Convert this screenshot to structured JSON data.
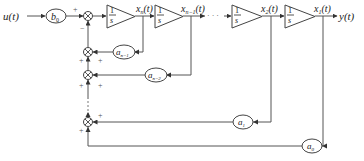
{
  "diagram": {
    "type": "block-diagram",
    "input_label": "u(t)",
    "output_label": "y(t)",
    "input_gain": {
      "label": "b",
      "subscript": "0"
    },
    "integrators": [
      {
        "id": "int1",
        "numerator": "1",
        "denominator": "s",
        "output_label": "x",
        "output_sub": "n",
        "output_suffix": "(t)"
      },
      {
        "id": "int2",
        "numerator": "1",
        "denominator": "s",
        "output_label": "x",
        "output_sub": "n−1",
        "output_suffix": "(t)"
      },
      {
        "id": "int3",
        "numerator": "1",
        "denominator": "s",
        "output_label": "x",
        "output_sub": "2",
        "output_suffix": "(t)"
      },
      {
        "id": "int4",
        "numerator": "1",
        "denominator": "s",
        "output_label": "x",
        "output_sub": "1",
        "output_suffix": "(t)"
      }
    ],
    "feedback_gains": [
      {
        "label": "a",
        "subscript": "n−1"
      },
      {
        "label": "a",
        "subscript": "n−2"
      },
      {
        "label": "a",
        "subscript": "1"
      },
      {
        "label": "a",
        "subscript": "0"
      }
    ],
    "signs": {
      "main_sum_top": "+",
      "main_sum_bottom": "−",
      "plus": "+"
    },
    "ellipsis": "· · ·"
  }
}
